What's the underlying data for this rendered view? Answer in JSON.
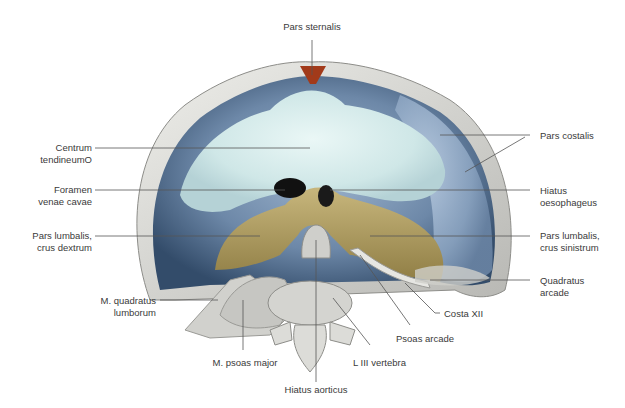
{
  "figure": {
    "colors": {
      "background": "#ffffff",
      "rib_bone": "#d8d8d4",
      "rib_shadow": "#9a9a96",
      "muscle_blue_dark": "#3f5a78",
      "muscle_blue_light": "#8aa6c4",
      "central_tendon": "#d9efee",
      "crura_tan": "#b8a468",
      "crura_dark": "#8a7840",
      "vertebra": "#cfcfcb",
      "sternal_red": "#a23a1a",
      "foramen_black": "#111111",
      "leader_line": "#555555",
      "label_text": "#3a3a3a"
    },
    "labels": {
      "pars_sternalis": "Pars sternalis",
      "centrum_tendineum": "Centrum\ntendineumO",
      "foramen_venae_cavae": "Foramen\nvenae cavae",
      "pars_lumbalis_dextrum": "Pars lumbalis,\ncrus dextrum",
      "m_quadratus_lumborum": "M. quadratus\nlumborum",
      "m_psoas_major": "M. psoas major",
      "hiatus_aorticus": "Hiatus aorticus",
      "l_iii_vertebra": "L III vertebra",
      "psoas_arcade": "Psoas arcade",
      "costa_xii": "Costa XII",
      "quadratus_arcade": "Quadratus\narcade",
      "pars_lumbalis_sinistrum": "Pars lumbalis,\ncrus sinistrum",
      "hiatus_oesophageus": "Hiatus\noesophageus",
      "pars_costalis": "Pars costalis"
    }
  }
}
